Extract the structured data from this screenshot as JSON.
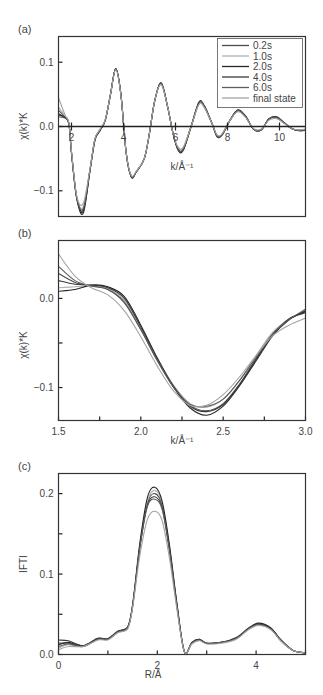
{
  "figure": {
    "series_names": [
      "0.2s",
      "1.0s",
      "2.0s",
      "4.0s",
      "6.0s",
      "final state"
    ],
    "series_colors": [
      "#4a4a4a",
      "#b0b0b0",
      "#262626",
      "#3a3a3a",
      "#5c5c5c",
      "#a3a3a3"
    ]
  },
  "chart_data": [
    {
      "panel": "(a)",
      "type": "line",
      "title": "",
      "xlabel": "k/Å⁻¹",
      "ylabel": "χ(k)*K",
      "xlim": [
        1.5,
        11.0
      ],
      "ylim": [
        -0.14,
        0.14
      ],
      "xticks": [
        2,
        4,
        6,
        8,
        10
      ],
      "xtick_labels": [
        "2",
        "4",
        "6",
        "8",
        "10"
      ],
      "yticks": [
        -0.1,
        0.0,
        0.1
      ],
      "ytick_labels": [
        "−0.1",
        "0.0",
        "0.1"
      ],
      "x_axis_at_zero": true,
      "grid": false,
      "legend_position": "upper right",
      "legend": [
        "0.2s",
        "1.0s",
        "2.0s",
        "4.0s",
        "6.0s",
        "final state"
      ],
      "x": [
        1.5,
        1.75,
        1.9,
        2.0,
        2.2,
        2.45,
        2.7,
        2.9,
        3.1,
        3.3,
        3.5,
        3.7,
        3.9,
        4.1,
        4.3,
        4.5,
        4.8,
        5.0,
        5.2,
        5.45,
        5.7,
        5.9,
        6.1,
        6.3,
        6.6,
        6.9,
        7.1,
        7.4,
        7.6,
        7.8,
        8.1,
        8.4,
        8.7,
        9.0,
        9.3,
        9.6,
        9.9,
        10.2,
        10.5,
        10.8,
        11.0
      ],
      "series": [
        {
          "name": "0.2s",
          "values": [
            0.025,
            0.015,
            0.005,
            -0.04,
            -0.11,
            -0.13,
            -0.07,
            -0.02,
            -0.005,
            0.01,
            0.05,
            0.09,
            0.05,
            -0.04,
            -0.078,
            -0.07,
            -0.05,
            -0.01,
            0.04,
            0.067,
            0.03,
            -0.01,
            -0.035,
            -0.035,
            0.0,
            0.036,
            0.032,
            0.005,
            -0.015,
            -0.012,
            0.01,
            0.025,
            0.015,
            -0.004,
            -0.005,
            0.012,
            0.014,
            0.005,
            -0.004,
            -0.006,
            -0.005
          ]
        },
        {
          "name": "1.0s",
          "values": [
            0.03,
            0.016,
            0.005,
            -0.04,
            -0.11,
            -0.125,
            -0.07,
            -0.02,
            -0.005,
            0.01,
            0.05,
            0.089,
            0.05,
            -0.04,
            -0.077,
            -0.07,
            -0.05,
            -0.01,
            0.04,
            0.066,
            0.03,
            -0.01,
            -0.033,
            -0.033,
            0.0,
            0.035,
            0.031,
            0.005,
            -0.014,
            -0.012,
            0.01,
            0.024,
            0.015,
            -0.004,
            -0.005,
            0.011,
            0.013,
            0.005,
            -0.004,
            -0.006,
            -0.005
          ]
        },
        {
          "name": "2.0s",
          "values": [
            0.02,
            0.014,
            0.004,
            -0.042,
            -0.112,
            -0.135,
            -0.072,
            -0.022,
            -0.006,
            0.01,
            0.05,
            0.09,
            0.05,
            -0.04,
            -0.079,
            -0.07,
            -0.05,
            -0.01,
            0.04,
            0.068,
            0.03,
            -0.01,
            -0.037,
            -0.037,
            0.0,
            0.038,
            0.033,
            0.005,
            -0.016,
            -0.013,
            0.01,
            0.026,
            0.016,
            -0.004,
            -0.005,
            0.012,
            0.015,
            0.005,
            -0.004,
            -0.007,
            -0.006
          ]
        },
        {
          "name": "4.0s",
          "values": [
            0.018,
            0.014,
            0.004,
            -0.041,
            -0.111,
            -0.132,
            -0.071,
            -0.021,
            -0.006,
            0.01,
            0.05,
            0.09,
            0.05,
            -0.04,
            -0.078,
            -0.07,
            -0.05,
            -0.01,
            0.04,
            0.067,
            0.03,
            -0.01,
            -0.036,
            -0.036,
            0.0,
            0.037,
            0.032,
            0.005,
            -0.015,
            -0.012,
            0.01,
            0.025,
            0.015,
            -0.004,
            -0.005,
            0.012,
            0.014,
            0.005,
            -0.004,
            -0.006,
            -0.005
          ]
        },
        {
          "name": "6.0s",
          "values": [
            0.015,
            0.013,
            0.004,
            -0.04,
            -0.11,
            -0.128,
            -0.07,
            -0.02,
            -0.005,
            0.01,
            0.05,
            0.09,
            0.05,
            -0.04,
            -0.078,
            -0.07,
            -0.05,
            -0.01,
            0.04,
            0.067,
            0.03,
            -0.01,
            -0.035,
            -0.035,
            0.0,
            0.036,
            0.032,
            0.005,
            -0.015,
            -0.012,
            0.01,
            0.025,
            0.015,
            -0.004,
            -0.005,
            0.012,
            0.014,
            0.005,
            -0.004,
            -0.006,
            -0.005
          ]
        },
        {
          "name": "final state",
          "values": [
            0.045,
            0.018,
            0.006,
            -0.038,
            -0.108,
            -0.12,
            -0.068,
            -0.019,
            -0.004,
            0.011,
            0.05,
            0.088,
            0.049,
            -0.04,
            -0.076,
            -0.069,
            -0.05,
            -0.01,
            0.04,
            0.065,
            0.03,
            -0.01,
            -0.032,
            -0.032,
            0.0,
            0.034,
            0.03,
            0.005,
            -0.013,
            -0.011,
            0.01,
            0.023,
            0.014,
            -0.003,
            -0.004,
            0.01,
            0.012,
            0.004,
            -0.004,
            -0.005,
            -0.004
          ]
        }
      ]
    },
    {
      "panel": "(b)",
      "type": "line",
      "title": "",
      "xlabel": "k/Å⁻¹",
      "ylabel": "χ(k)*K",
      "xlim": [
        1.5,
        3.0
      ],
      "ylim": [
        -0.137,
        0.065
      ],
      "xticks": [
        1.5,
        1.75,
        2.0,
        2.25,
        2.5,
        2.75,
        3.0
      ],
      "xtick_labels": [
        "1.5",
        "",
        "2.0",
        "",
        "2.5",
        "",
        "3.0"
      ],
      "yticks": [
        -0.1,
        -0.05,
        0.0
      ],
      "ytick_labels": [
        "−0.1",
        "",
        "0.0"
      ],
      "grid": false,
      "x": [
        1.5,
        1.6,
        1.7,
        1.8,
        1.9,
        2.0,
        2.1,
        2.2,
        2.3,
        2.4,
        2.5,
        2.6,
        2.7,
        2.8,
        2.9,
        3.0
      ],
      "series": [
        {
          "name": "0.2s",
          "values": [
            0.028,
            0.018,
            0.014,
            0.01,
            -0.005,
            -0.035,
            -0.07,
            -0.1,
            -0.12,
            -0.126,
            -0.118,
            -0.096,
            -0.068,
            -0.04,
            -0.023,
            -0.015
          ]
        },
        {
          "name": "1.0s",
          "values": [
            0.012,
            0.013,
            0.014,
            0.011,
            -0.002,
            -0.032,
            -0.067,
            -0.098,
            -0.118,
            -0.122,
            -0.113,
            -0.092,
            -0.064,
            -0.038,
            -0.024,
            -0.013
          ]
        },
        {
          "name": "2.0s",
          "values": [
            0.008,
            0.01,
            0.015,
            0.013,
            0.002,
            -0.03,
            -0.067,
            -0.1,
            -0.123,
            -0.131,
            -0.121,
            -0.098,
            -0.07,
            -0.042,
            -0.024,
            -0.014
          ]
        },
        {
          "name": "4.0s",
          "values": [
            0.02,
            0.016,
            0.015,
            0.012,
            0.0,
            -0.032,
            -0.068,
            -0.099,
            -0.121,
            -0.127,
            -0.119,
            -0.097,
            -0.068,
            -0.041,
            -0.023,
            -0.016
          ]
        },
        {
          "name": "6.0s",
          "values": [
            0.036,
            0.02,
            0.014,
            0.01,
            -0.004,
            -0.035,
            -0.069,
            -0.1,
            -0.119,
            -0.121,
            -0.113,
            -0.092,
            -0.066,
            -0.04,
            -0.024,
            -0.012
          ]
        },
        {
          "name": "final state",
          "values": [
            0.05,
            0.025,
            0.012,
            0.004,
            -0.014,
            -0.043,
            -0.076,
            -0.104,
            -0.12,
            -0.12,
            -0.108,
            -0.088,
            -0.064,
            -0.042,
            -0.03,
            -0.022
          ]
        }
      ]
    },
    {
      "panel": "(c)",
      "type": "line",
      "title": "",
      "xlabel": "R/Å",
      "ylabel": "IFTI",
      "xlim": [
        0,
        5
      ],
      "ylim": [
        0,
        0.225
      ],
      "xticks": [
        0,
        1,
        2,
        3,
        4,
        5
      ],
      "xtick_labels": [
        "0",
        "",
        "2",
        "",
        "4",
        ""
      ],
      "yticks": [
        0.0,
        0.05,
        0.1,
        0.15,
        0.2
      ],
      "ytick_labels": [
        "0.0",
        "",
        "0.1",
        "",
        "0.2"
      ],
      "grid": false,
      "x": [
        0.0,
        0.2,
        0.5,
        0.8,
        1.0,
        1.2,
        1.4,
        1.5,
        1.65,
        1.8,
        1.95,
        2.1,
        2.25,
        2.4,
        2.55,
        2.7,
        2.85,
        3.0,
        3.3,
        3.6,
        3.85,
        4.05,
        4.3,
        4.5,
        4.75,
        5.0
      ],
      "series": [
        {
          "name": "0.2s",
          "values": [
            0.014,
            0.014,
            0.01,
            0.019,
            0.019,
            0.028,
            0.033,
            0.06,
            0.135,
            0.188,
            0.2,
            0.185,
            0.13,
            0.06,
            0.003,
            0.014,
            0.018,
            0.014,
            0.015,
            0.02,
            0.032,
            0.038,
            0.032,
            0.018,
            0.005,
            0.002
          ]
        },
        {
          "name": "1.0s",
          "values": [
            0.008,
            0.012,
            0.01,
            0.019,
            0.019,
            0.028,
            0.033,
            0.06,
            0.135,
            0.19,
            0.204,
            0.188,
            0.132,
            0.06,
            0.003,
            0.014,
            0.018,
            0.014,
            0.015,
            0.02,
            0.032,
            0.038,
            0.032,
            0.018,
            0.005,
            0.002
          ]
        },
        {
          "name": "2.0s",
          "values": [
            0.012,
            0.015,
            0.011,
            0.02,
            0.02,
            0.029,
            0.034,
            0.062,
            0.14,
            0.195,
            0.208,
            0.19,
            0.134,
            0.062,
            0.003,
            0.015,
            0.019,
            0.014,
            0.015,
            0.021,
            0.033,
            0.039,
            0.033,
            0.018,
            0.005,
            0.002
          ]
        },
        {
          "name": "4.0s",
          "values": [
            0.018,
            0.017,
            0.011,
            0.02,
            0.019,
            0.029,
            0.034,
            0.06,
            0.135,
            0.186,
            0.196,
            0.182,
            0.128,
            0.059,
            0.003,
            0.015,
            0.019,
            0.014,
            0.015,
            0.02,
            0.033,
            0.038,
            0.032,
            0.018,
            0.005,
            0.002
          ]
        },
        {
          "name": "6.0s",
          "values": [
            0.01,
            0.013,
            0.01,
            0.019,
            0.019,
            0.028,
            0.033,
            0.06,
            0.134,
            0.184,
            0.193,
            0.18,
            0.127,
            0.058,
            0.003,
            0.014,
            0.018,
            0.014,
            0.015,
            0.02,
            0.032,
            0.037,
            0.031,
            0.017,
            0.005,
            0.002
          ]
        },
        {
          "name": "final state",
          "values": [
            0.006,
            0.01,
            0.01,
            0.018,
            0.018,
            0.027,
            0.032,
            0.058,
            0.124,
            0.168,
            0.178,
            0.166,
            0.118,
            0.055,
            0.003,
            0.013,
            0.017,
            0.013,
            0.014,
            0.019,
            0.031,
            0.036,
            0.031,
            0.017,
            0.005,
            0.002
          ]
        }
      ]
    }
  ]
}
